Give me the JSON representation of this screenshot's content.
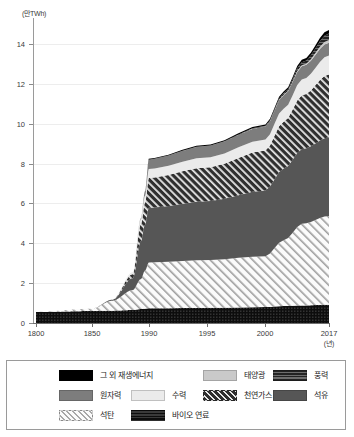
{
  "chart_data": {
    "type": "area",
    "title": "",
    "subtitle": "",
    "ylabel": "(만TWh)",
    "xlabel": "(년)",
    "ylim": [
      0,
      15.3
    ],
    "yticks": [
      0,
      2,
      4,
      6,
      8,
      10,
      12,
      14
    ],
    "ytick_labels": [
      "0",
      "2",
      "4",
      "6",
      "8",
      "10",
      "12",
      "14"
    ],
    "grid": true,
    "legend_position": "bottom",
    "x_axis_note": "non-linear axis: 1800-1850-1990 compressed, 1990-2017 expanded",
    "xticks": [
      1800,
      1850,
      1990,
      1995,
      2000,
      2017
    ],
    "xtick_labels": [
      "1800",
      "1850",
      "1990",
      "1995",
      "2000",
      "2017"
    ],
    "x": [
      1800,
      1850,
      1900,
      1950,
      1970,
      1980,
      1990,
      1995,
      2000,
      2005,
      2010,
      2017
    ],
    "series": [
      {
        "name": "바이오 연료",
        "key": "biofuel",
        "style": "solid-dark-textured",
        "color": "#111111",
        "values": [
          0.55,
          0.6,
          0.62,
          0.65,
          0.7,
          0.72,
          0.74,
          0.76,
          0.8,
          0.85,
          0.88,
          0.92
        ]
      },
      {
        "name": "석탄",
        "key": "coal",
        "style": "diagonal-hatch-light",
        "color": "#f2f2f2",
        "values": [
          0.01,
          0.12,
          0.5,
          1.0,
          1.5,
          1.9,
          2.3,
          2.4,
          2.55,
          3.3,
          4.1,
          4.45
        ]
      },
      {
        "name": "석유",
        "key": "oil",
        "style": "solid-gray",
        "color": "#565656",
        "values": [
          0.0,
          0.0,
          0.05,
          0.6,
          1.9,
          2.3,
          2.75,
          2.95,
          3.3,
          3.6,
          3.75,
          3.95
        ]
      },
      {
        "name": "천연가스",
        "key": "natural-gas",
        "style": "diagonal-hatch-dark",
        "color": "#3b3b3b",
        "values": [
          0.0,
          0.0,
          0.0,
          0.2,
          0.85,
          1.1,
          1.5,
          1.7,
          2.0,
          2.35,
          2.7,
          3.15
        ]
      },
      {
        "name": "수력",
        "key": "hydro",
        "style": "solid-very-light",
        "color": "#ebebeb",
        "values": [
          0.0,
          0.0,
          0.0,
          0.1,
          0.25,
          0.35,
          0.45,
          0.5,
          0.55,
          0.65,
          0.8,
          0.95
        ]
      },
      {
        "name": "원자력",
        "key": "nuclear",
        "style": "solid-medium-gray",
        "color": "#7d7d7d",
        "values": [
          0.0,
          0.0,
          0.0,
          0.0,
          0.05,
          0.2,
          0.48,
          0.58,
          0.65,
          0.68,
          0.66,
          0.64
        ]
      },
      {
        "name": "태양광",
        "key": "solar",
        "style": "solid-light-gray",
        "color": "#c9c9c9",
        "values": [
          0.0,
          0.0,
          0.0,
          0.0,
          0.0,
          0.0,
          0.0,
          0.0,
          0.01,
          0.02,
          0.05,
          0.14
        ]
      },
      {
        "name": "풍력",
        "key": "wind",
        "style": "solid-dark-textured",
        "color": "#2e2e2e",
        "values": [
          0.0,
          0.0,
          0.0,
          0.0,
          0.0,
          0.0,
          0.0,
          0.01,
          0.03,
          0.07,
          0.15,
          0.32
        ]
      },
      {
        "name": "그 외 재생에너지",
        "key": "other-renewables",
        "style": "solid-black",
        "color": "#000000",
        "values": [
          0.0,
          0.0,
          0.0,
          0.0,
          0.0,
          0.02,
          0.04,
          0.05,
          0.07,
          0.09,
          0.12,
          0.18
        ]
      }
    ]
  },
  "legend": {
    "rows": [
      [
        {
          "label": "그 외 재생에너지",
          "key": "other-renewables"
        },
        {
          "label": "태양광",
          "key": "solar"
        },
        {
          "label": "풍력",
          "key": "wind"
        }
      ],
      [
        {
          "label": "원자력",
          "key": "nuclear"
        },
        {
          "label": "수력",
          "key": "hydro"
        },
        {
          "label": "천연가스",
          "key": "natural-gas"
        },
        {
          "label": "석유",
          "key": "oil"
        }
      ],
      [
        {
          "label": "석탄",
          "key": "coal"
        },
        {
          "label": "바이오 연료",
          "key": "biofuel"
        }
      ]
    ]
  }
}
